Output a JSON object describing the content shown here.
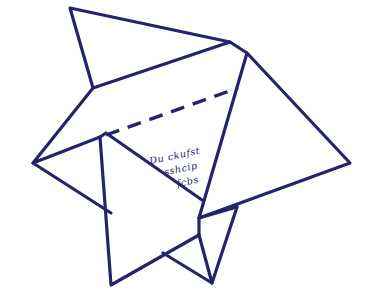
{
  "diagram": {
    "type": "origami-fold-diagram",
    "stroke_color": "#24246a",
    "background": "#ffffff",
    "handwritten_note": {
      "lines": [
        "Du ckufst",
        "sshcip",
        "fcbs"
      ],
      "legible": false
    },
    "fold_line": {
      "style": "dashed",
      "meaning": "valley-fold"
    }
  }
}
